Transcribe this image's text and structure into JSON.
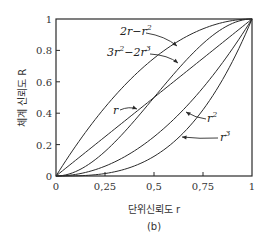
{
  "chart_data": {
    "type": "line",
    "title": "",
    "caption": "(b)",
    "xlabel": "단위신뢰도 r",
    "ylabel": "체계 신뢰도 R",
    "xlim": [
      0,
      1
    ],
    "ylim": [
      0,
      1
    ],
    "grid": false,
    "x_ticks": [
      0,
      0.25,
      0.5,
      0.75,
      1
    ],
    "x_tick_labels": [
      "0",
      "0,25",
      "0,5",
      "0,75",
      "1"
    ],
    "y_ticks": [
      0,
      0.2,
      0.4,
      0.6,
      0.8,
      1
    ],
    "y_tick_labels": [
      "0",
      "0.2",
      "0.4",
      "0.6",
      "0.8",
      "1"
    ],
    "series": [
      {
        "name": "2r−r²",
        "label_main": "2r−r",
        "label_sup": "2",
        "formula": "2r - r^2",
        "x": [
          0,
          0.25,
          0.5,
          0.75,
          1
        ],
        "values": [
          0,
          0.4375,
          0.75,
          0.9375,
          1
        ]
      },
      {
        "name": "3r²−2r³",
        "label_main": "3r",
        "label_sup": "2",
        "label_main2": "−2r",
        "label_sup2": "3",
        "formula": "3r^2 - 2r^3",
        "x": [
          0,
          0.25,
          0.5,
          0.75,
          1
        ],
        "values": [
          0,
          0.15625,
          0.5,
          0.84375,
          1
        ]
      },
      {
        "name": "r",
        "label_main": "r",
        "label_sup": "",
        "formula": "r",
        "x": [
          0,
          0.25,
          0.5,
          0.75,
          1
        ],
        "values": [
          0,
          0.25,
          0.5,
          0.75,
          1
        ]
      },
      {
        "name": "r²",
        "label_main": "r",
        "label_sup": "2",
        "formula": "r^2",
        "x": [
          0,
          0.25,
          0.5,
          0.75,
          1
        ],
        "values": [
          0,
          0.0625,
          0.25,
          0.5625,
          1
        ]
      },
      {
        "name": "r³",
        "label_main": "r",
        "label_sup": "3",
        "formula": "r^3",
        "x": [
          0,
          0.25,
          0.5,
          0.75,
          1
        ],
        "values": [
          0,
          0.015625,
          0.125,
          0.421875,
          1
        ]
      }
    ],
    "legend": "annotated-arrows",
    "line_color": "#2a2a2a"
  }
}
